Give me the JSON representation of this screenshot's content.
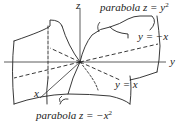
{
  "diagram": {
    "axes": {
      "x": "x",
      "y": "y",
      "z": "z"
    },
    "labels": {
      "parabola_top": {
        "text": "parabola z = y",
        "exp": "2"
      },
      "parabola_bottom": {
        "text": "parabola z = −x",
        "exp": "2"
      },
      "line_neg": "y = −x",
      "line_pos": "y = x"
    },
    "colors": {
      "stroke": "#222222",
      "background": "#ffffff"
    }
  }
}
